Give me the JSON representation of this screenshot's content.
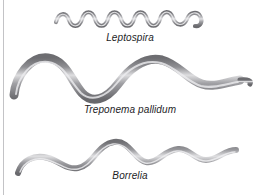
{
  "figure": {
    "background_color": "#ffffff",
    "rule_color": "#c3c3c6",
    "label_color": "#1d1d1f",
    "filament_dark": "#6e6e72",
    "filament_mid": "#9a9a9e",
    "filament_light": "#e6e6e8"
  },
  "organisms": [
    {
      "name": "leptospira",
      "label": "Leptospira",
      "shape": "tight-high-frequency-spiral-filament",
      "wave_count": 9,
      "thickness_px": 4,
      "end_detail": "hooked-right-tip"
    },
    {
      "name": "treponema",
      "label": "Treponema pallidum",
      "shape": "thick-low-frequency-sine-filament",
      "wave_count": 2,
      "thickness_px": 9,
      "end_detail": "tapered-right-tip"
    },
    {
      "name": "borrelia",
      "label": "Borrelia",
      "shape": "irregular-medium-frequency-filament",
      "wave_count": 4,
      "thickness_px": 6,
      "end_detail": "tapered-both-tips"
    }
  ]
}
